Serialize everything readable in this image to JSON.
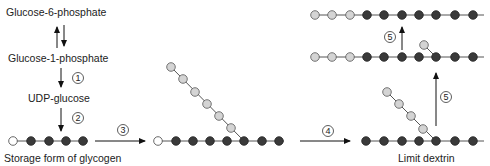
{
  "labels": {
    "g6p": "Glucose-6-phosphate",
    "g1p": "Glucose-1-phosphate",
    "udp": "UDP-glucose",
    "storage": "Storage form of glycogen",
    "limit": "Limit dextrin"
  },
  "steps": [
    "1",
    "2",
    "3",
    "4",
    "5",
    "5"
  ],
  "colors": {
    "dark_residue": "#3a3a3a",
    "light_residue": "#d4d4d4",
    "reducing_end": "#ffffff",
    "line": "#555555"
  }
}
